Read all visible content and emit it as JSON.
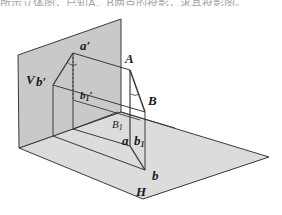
{
  "header": {
    "cut_text": "所示立体图，已知A、B两点的投影，求其投影图。"
  },
  "diagram": {
    "colors": {
      "v_plane": "#c9c9c9",
      "h_plane": "#dcdcdc",
      "stroke": "#3a3a3a"
    },
    "labels": {
      "V": "V",
      "H": "H",
      "A": "A",
      "B": "B",
      "B1": "B",
      "B1_sub": "1",
      "a_prime": "a′",
      "b_prime": "b′",
      "b1_prime": "b",
      "b1_prime_sub": "1",
      "b1_prime_mark": "′",
      "a": "a",
      "b": "b",
      "b1": "b",
      "b1_sub": "1"
    }
  }
}
